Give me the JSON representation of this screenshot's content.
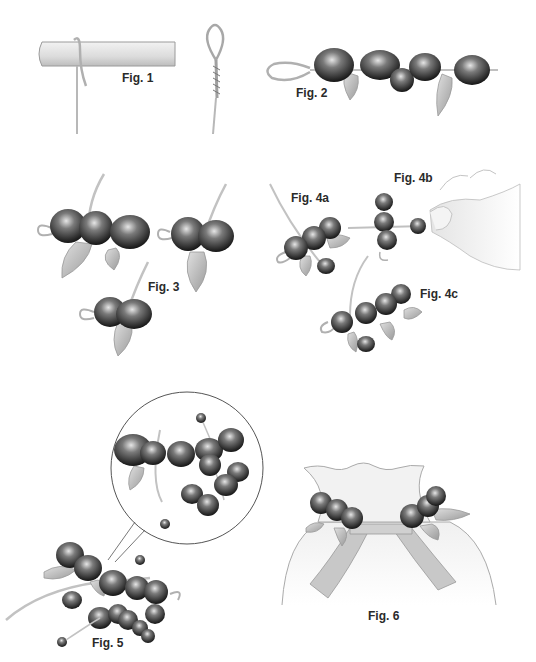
{
  "figures": [
    {
      "id": "fig1",
      "label": "Fig. 1",
      "description": "wire wrapped around a rod and a twisted loop"
    },
    {
      "id": "fig2",
      "label": "Fig. 2",
      "description": "beads and leaves strung on wire with loop end"
    },
    {
      "id": "fig3",
      "label": "Fig. 3",
      "description": "three steps of twisting bead and leaf clusters"
    },
    {
      "id": "fig4a",
      "label": "Fig. 4a",
      "description": "small bead cluster with leaves on stem"
    },
    {
      "id": "fig4b",
      "label": "Fig. 4b",
      "description": "hand holding bead while twisting wire"
    },
    {
      "id": "fig4c",
      "label": "Fig. 4c",
      "description": "finished bead cluster with leaves"
    },
    {
      "id": "fig5",
      "label": "Fig. 5",
      "description": "assembled berry spray with magnified detail circle"
    },
    {
      "id": "fig6",
      "label": "Fig. 6",
      "description": "berry sprays attached to ribbon on a gathered bag"
    }
  ],
  "colors": {
    "bead_dark": "#1e1e1e",
    "bead_mid": "#6a6a6a",
    "bead_light": "#d8d8d8",
    "wire": "#c8c8c8",
    "leaf": "#bdbdbd",
    "outline": "#8a8a8a",
    "label": "#2a2a2a"
  }
}
